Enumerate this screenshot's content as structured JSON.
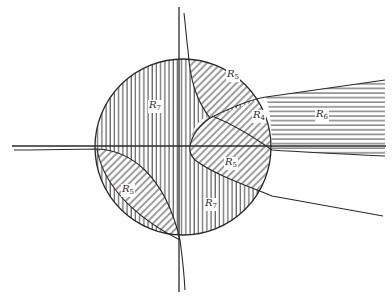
{
  "diagram": {
    "type": "region-partition",
    "colors": {
      "ink": "#2a2a2a",
      "background": "#ffffff"
    },
    "regions": [
      {
        "id": "R7-upper",
        "letter": "R",
        "sub": "7",
        "hatch": "vertical",
        "x": 118,
        "y": 97
      },
      {
        "id": "R5-upper",
        "letter": "R",
        "sub": "5",
        "hatch": "diagonal",
        "x": 227,
        "y": 70
      },
      {
        "id": "R4",
        "letter": "R",
        "sub": "4",
        "hatch": "diagonal",
        "x": 251,
        "y": 111
      },
      {
        "id": "R6",
        "letter": "R",
        "sub": "6",
        "hatch": "horizontal",
        "x": 315,
        "y": 111
      },
      {
        "id": "R5-lower",
        "letter": "R",
        "sub": "5",
        "hatch": "diagonal",
        "x": 223,
        "y": 158
      },
      {
        "id": "R5-left",
        "letter": "R",
        "sub": "5",
        "hatch": "diagonal",
        "x": 120,
        "y": 184
      },
      {
        "id": "R7-lower",
        "letter": "R",
        "sub": "7",
        "hatch": "vertical",
        "x": 203,
        "y": 199
      }
    ]
  }
}
